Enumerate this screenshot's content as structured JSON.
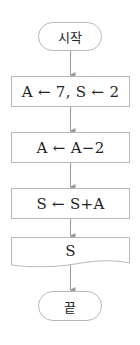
{
  "flowchart": {
    "colors": {
      "stroke": "#b8b8b8",
      "arrow": "#9a9a9a",
      "text": "#222222",
      "background": "#ffffff"
    },
    "nodes": [
      {
        "id": "start",
        "type": "terminal",
        "label": "시작"
      },
      {
        "id": "init",
        "type": "process",
        "label": "A ← 7, S ← 2"
      },
      {
        "id": "update-a",
        "type": "process",
        "label": "A ← A−2"
      },
      {
        "id": "update-s",
        "type": "process",
        "label": "S ← S+A"
      },
      {
        "id": "output",
        "type": "output",
        "label": "S"
      },
      {
        "id": "end",
        "type": "terminal",
        "label": "끝"
      }
    ],
    "edges": [
      {
        "from": "start",
        "to": "init"
      },
      {
        "from": "init",
        "to": "update-a"
      },
      {
        "from": "update-a",
        "to": "update-s"
      },
      {
        "from": "update-s",
        "to": "output"
      },
      {
        "from": "output",
        "to": "end"
      }
    ]
  }
}
